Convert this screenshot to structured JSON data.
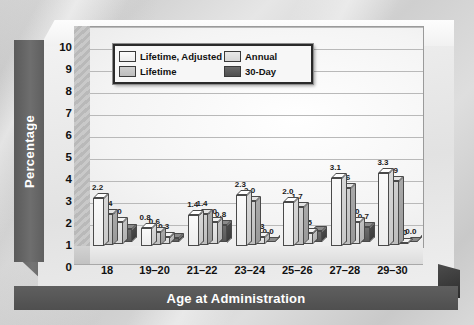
{
  "chart_data": {
    "type": "bar",
    "title": "",
    "xlabel": "Age at Administration",
    "ylabel": "Percentage",
    "ylim": [
      0,
      10
    ],
    "yticks": [
      10,
      9,
      8,
      7,
      6,
      5,
      4,
      3,
      2,
      1,
      0
    ],
    "grid": true,
    "legend_position": "top-center-inside",
    "categories": [
      "18",
      "19–20",
      "21–22",
      "23–24",
      "25–26",
      "27–28",
      "29–30"
    ],
    "series": [
      {
        "name": "Lifetime, Adjusted",
        "color": "#fafafa",
        "values": [
          2.2,
          0.8,
          1.4,
          2.3,
          2.0,
          3.1,
          3.3
        ],
        "labels": [
          "2.2",
          "0.8",
          "1.4",
          "2.3",
          "2.0",
          "3.1",
          "3.3"
        ]
      },
      {
        "name": "Lifetime",
        "color": "#c6c6c6",
        "values": [
          1.4,
          0.6,
          1.4,
          2.0,
          1.7,
          2.6,
          2.9
        ],
        "labels": [
          "1.4",
          "0.6",
          "1.4",
          "2.0",
          "1.7",
          "2.6",
          "2.9"
        ]
      },
      {
        "name": "Annual",
        "color": "#e0e0e0",
        "values": [
          1.0,
          0.3,
          1.0,
          0.3,
          0.5,
          1.0,
          0.0
        ],
        "labels": [
          "1.0",
          "0.3",
          "1.0",
          "0.3",
          "0.5",
          "1.0",
          "0.0"
        ]
      },
      {
        "name": "30-Day",
        "color": "#5d5d5d",
        "values": [
          0.6,
          0.2,
          0.8,
          0.0,
          0.5,
          0.7,
          0.0
        ],
        "labels": [
          "",
          "",
          "0.8",
          "0.0",
          "",
          "0.7",
          "0.0"
        ]
      }
    ]
  },
  "legend": {
    "entries": [
      {
        "label": "Lifetime, Adjusted"
      },
      {
        "label": "Annual"
      },
      {
        "label": "Lifetime"
      },
      {
        "label": "30-Day"
      }
    ]
  },
  "axes": {
    "y_title": "Percentage",
    "x_title": "Age at Administration"
  }
}
